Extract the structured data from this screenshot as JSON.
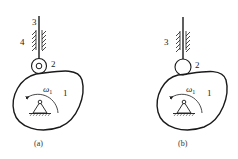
{
  "diagram": {
    "type": "cam-follower mechanisms",
    "panels": [
      {
        "id": "a",
        "caption": "(a)",
        "follower_type": "roller follower",
        "labels": {
          "cam": "1",
          "roller": "2",
          "follower_rod": "3",
          "guide_frame": "4",
          "angular_velocity": "ω",
          "angular_velocity_subscript": "1"
        }
      },
      {
        "id": "b",
        "caption": "(b)",
        "follower_type": "spherical/round-tip follower",
        "labels": {
          "cam": "1",
          "tip": "2",
          "follower_rod_and_guide": "3",
          "angular_velocity": "ω",
          "angular_velocity_subscript": "1"
        }
      }
    ],
    "colors": {
      "stroke": "#1a1a1a",
      "background": "#ffffff"
    }
  }
}
